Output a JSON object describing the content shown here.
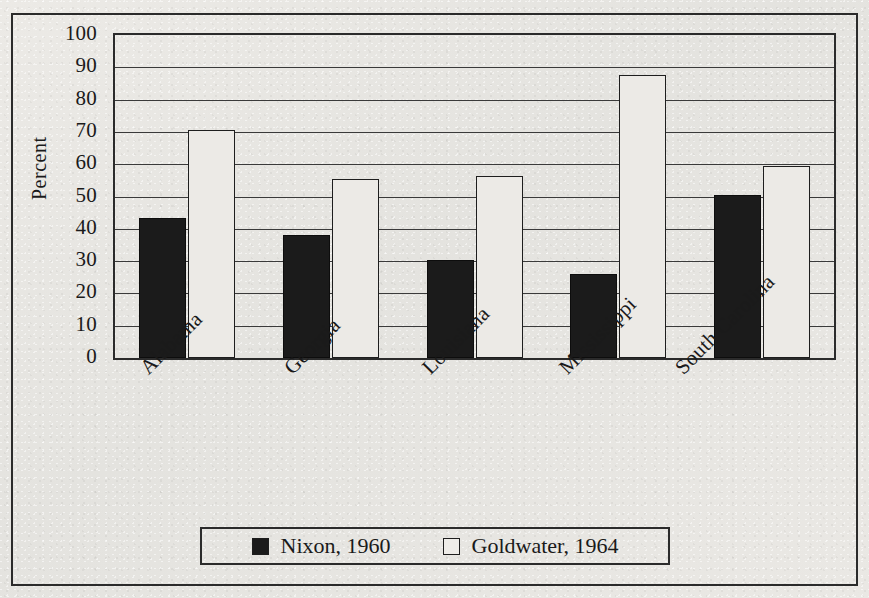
{
  "figure": {
    "ylabel": "Percent",
    "legend": {
      "items": [
        {
          "label": "Nixon, 1960",
          "swatch": "filled-square-icon",
          "color": "#1b1b1b"
        },
        {
          "label": "Goldwater, 1964",
          "swatch": "hollow-square-icon",
          "color": "#eceae6"
        }
      ]
    }
  },
  "chart_data": {
    "type": "bar",
    "title": "",
    "xlabel": "",
    "ylabel": "Percent",
    "ylim": [
      0,
      100
    ],
    "yticks": [
      0,
      10,
      20,
      30,
      40,
      50,
      60,
      70,
      80,
      90,
      100
    ],
    "grid": true,
    "legend_position": "bottom",
    "categories": [
      "Alabama",
      "Georgia",
      "Louisiana",
      "Mississippi",
      "South Carolina"
    ],
    "series": [
      {
        "name": "Nixon, 1960",
        "color": "#1b1b1b",
        "values": [
          43.5,
          38,
          30.5,
          26,
          50.5
        ]
      },
      {
        "name": "Goldwater, 1964",
        "color": "#eceae6",
        "values": [
          70.5,
          55.5,
          56.5,
          87.5,
          59.5
        ]
      }
    ]
  }
}
